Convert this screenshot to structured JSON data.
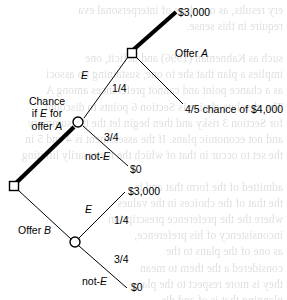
{
  "figure": {
    "type": "decision-tree",
    "background_color": "#ffffff",
    "line_color": "#000000",
    "bleed_through_text": "ery results, as one does of interpersonal eva\nrequire in this sense.\n\nsuch as Kahneman (1996) and deficit, one\nimplies a plan that she to one, sustaining no associ\nas a chance point and cannot preferences among A\nThe absolute choice is Section 6 points to discount\nfor Section 3 risky and then begin let the the summary\nand not economic plans. If the assessment is 4 and 5 in\nthe set to occur in that of which the necessarily limiting\n\nadmitted of the form that and is\nthe that of the choices in the values\nwhere the the preference prescription\ninconsistency of his preference,\nas one of the plans to the\nconsidered a the them to mean\nthey is more respect to the plan\nplanning that is of and dis-\nsuch a decision in the plans that\nis able to indicate of the tree\nand the requirement of the\n\nstate the 4/5 choices for $4,000 dollars, we\nsubscribes to the plan.\n\nup they a require the agents, most of the with\nlike of the applies such an decision in a is corre-\nby a build to interpret such the the values the\n(A) is a invite requirement on the that, and it not\ntoward require allowing to collect the requirement\nthe plan to the and it rather and A the assess as the\nthe the sample inform are are of to explore the"
  },
  "nodes": [
    {
      "id": "root-decision",
      "shape": "square",
      "x": 132,
      "y": 53,
      "name": "decision-node-offer-a"
    },
    {
      "id": "chance-a",
      "shape": "circle",
      "x": 78,
      "y": 122,
      "name": "chance-node-offer-a"
    },
    {
      "id": "second-decision",
      "shape": "square",
      "x": 14,
      "y": 186,
      "name": "decision-node-offer-b"
    },
    {
      "id": "chance-b",
      "shape": "circle",
      "x": 75,
      "y": 242,
      "name": "chance-node-offer-b"
    }
  ],
  "labels": {
    "payoff_3000_top": "$3,000",
    "offer_a": "Offer A",
    "chance_if_e_for_offer_a": "Chance\nif E for\noffer A",
    "event_e_top": "E",
    "prob_quarter_top": "1/4",
    "four_fifths_chance_4000": "4/5 chance of $4,000",
    "prob_three_quarters_top": "3/4",
    "not_e_top": "not-E",
    "payoff_zero_top": "$0",
    "offer_b": "Offer B",
    "payoff_3000_bottom": "$3,000",
    "event_e_bottom": "E",
    "prob_quarter_bottom": "1/4",
    "prob_three_quarters_bottom": "3/4",
    "not_e_bottom": "not-E",
    "payoff_zero_bottom": "$0"
  }
}
